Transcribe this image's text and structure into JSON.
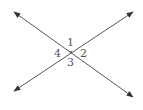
{
  "diagram": {
    "type": "intersecting-lines",
    "lines": [
      {
        "name": "line-descending",
        "arrows": "both"
      },
      {
        "name": "line-ascending",
        "arrows": "both"
      }
    ],
    "angle_labels": [
      "1",
      "2",
      "3",
      "4"
    ],
    "color": "#555555"
  }
}
